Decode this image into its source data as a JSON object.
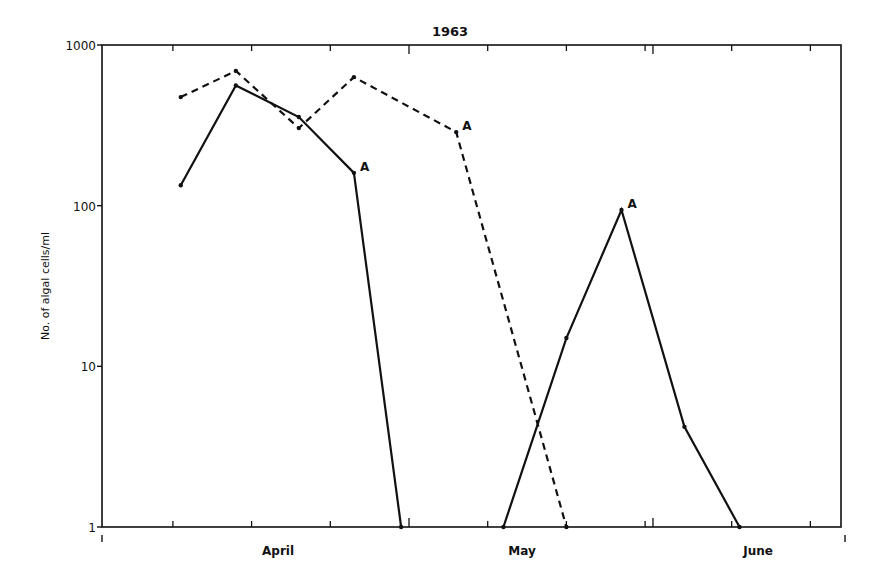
{
  "chart_data": {
    "type": "line",
    "title": "1963",
    "xlabel": "",
    "ylabel": "No. of algal cells/ml",
    "yscale": "log",
    "ylim": [
      1,
      1000
    ],
    "yticks": [
      1,
      10,
      100,
      1000
    ],
    "ytick_labels": [
      "1",
      "10",
      "100",
      "1000"
    ],
    "x_unit": "day_of_year_1963",
    "xlim": [
      82,
      174
    ],
    "x_month_labels": [
      {
        "label": "April",
        "at": 105
      },
      {
        "label": "May",
        "at": 136
      },
      {
        "label": "June",
        "at": 166
      }
    ],
    "x_month_boundaries": [
      82,
      121,
      152,
      174
    ],
    "x_minor_ticks": [
      91,
      101,
      111,
      121,
      131,
      141,
      151,
      152,
      162,
      172
    ],
    "grid": false,
    "legend": null,
    "series": [
      {
        "name": "Series 1 (solid, early spring)",
        "style": "solid",
        "points": [
          {
            "date": "Apr 2",
            "x": 92,
            "y": 134
          },
          {
            "date": "Apr 9",
            "x": 99,
            "y": 560
          },
          {
            "date": "Apr 17",
            "x": 107,
            "y": 356
          },
          {
            "date": "Apr 24",
            "x": 114,
            "y": 160,
            "annotation": "A"
          },
          {
            "date": "Apr 30",
            "x": 120,
            "y": 1
          }
        ]
      },
      {
        "name": "Series 2 (dashed)",
        "style": "dashed",
        "points": [
          {
            "date": "Apr 2",
            "x": 92,
            "y": 474
          },
          {
            "date": "Apr 9",
            "x": 99,
            "y": 690
          },
          {
            "date": "Apr 17",
            "x": 107,
            "y": 304
          },
          {
            "date": "Apr 24",
            "x": 114,
            "y": 631
          },
          {
            "date": "May 7",
            "x": 127,
            "y": 287,
            "annotation": "A"
          },
          {
            "date": "May 21",
            "x": 141,
            "y": 1
          }
        ]
      },
      {
        "name": "Series 3 (solid, late spring)",
        "style": "solid",
        "points": [
          {
            "date": "May 13",
            "x": 133,
            "y": 1
          },
          {
            "date": "May 21",
            "x": 141,
            "y": 15
          },
          {
            "date": "May 28",
            "x": 148,
            "y": 94,
            "annotation": "A"
          },
          {
            "date": "Jun 5",
            "x": 156,
            "y": 4.2
          },
          {
            "date": "Jun 12",
            "x": 163,
            "y": 1
          }
        ]
      }
    ],
    "annotations": [
      "A",
      "A",
      "A"
    ]
  }
}
